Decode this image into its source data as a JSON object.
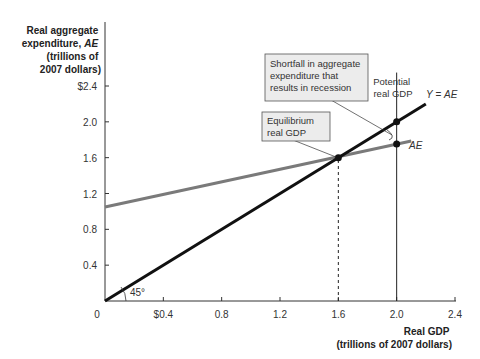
{
  "chart_data": {
    "type": "line",
    "title": "",
    "ylabel_lines": [
      "Real aggregate",
      "expenditure, ",
      "(trillions of",
      "2007 dollars)"
    ],
    "ylabel_italic": "AE",
    "xlabel_lines": [
      "Real GDP",
      "(trillions of 2007 dollars)"
    ],
    "xlim": [
      0,
      2.4
    ],
    "ylim": [
      0,
      2.4
    ],
    "x_ticks": [
      0.4,
      0.8,
      1.2,
      1.6,
      2.0,
      2.4
    ],
    "x_tick_labels": [
      "$0.4",
      "0.8",
      "1.2",
      "1.6",
      "2.0",
      "2.4"
    ],
    "y_ticks": [
      0.4,
      0.8,
      1.2,
      1.6,
      2.0,
      2.4
    ],
    "y_tick_labels": [
      "0.4",
      "0.8",
      "1.2",
      "1.6",
      "2.0",
      "$2.4"
    ],
    "origin_label": "0",
    "grid": false,
    "series": [
      {
        "name": "Y = AE",
        "x": [
          0,
          2.2
        ],
        "y": [
          0,
          2.2
        ],
        "color": "#111111"
      },
      {
        "name": "AE",
        "x": [
          0,
          2.1
        ],
        "y": [
          1.05,
          1.787
        ],
        "color": "#7a7a7a"
      }
    ],
    "points": [
      {
        "name": "equilibrium",
        "x": 1.6,
        "y": 1.6
      },
      {
        "name": "potential-on-45",
        "x": 2.0,
        "y": 2.0
      },
      {
        "name": "potential-on-ae",
        "x": 2.0,
        "y": 1.752
      }
    ],
    "vertical_lines": [
      {
        "name": "equilibrium-dashed",
        "x": 1.6,
        "y_top": 1.6,
        "style": "dashed"
      },
      {
        "name": "potential-line",
        "x": 2.0,
        "y_top": 2.55,
        "style": "solid"
      }
    ],
    "annotations": {
      "y_eq_ae_prefix": "Y",
      "y_eq_ae_mid": " = ",
      "y_eq_ae_suffix": "AE",
      "ae_label": "AE",
      "angle_label": "45°",
      "potential_lines": [
        "Potential",
        "real GDP"
      ],
      "equilibrium_lines": [
        "Equilibrium",
        "real GDP"
      ],
      "shortfall_lines": [
        "Shortfall in aggregate",
        "expenditure that",
        "results in recession"
      ]
    },
    "colors": {
      "axis": "#333333",
      "box_fill": "#ececec",
      "box_stroke": "#555555"
    }
  }
}
